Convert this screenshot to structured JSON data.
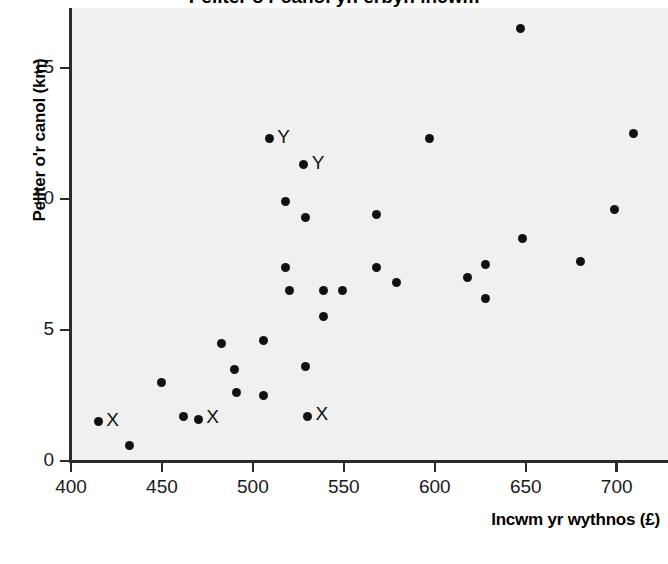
{
  "figure": {
    "background_color": "#ffffff",
    "panel_color": "#f0f0f0",
    "axis_color": "#2b2b2b",
    "marker_color": "#111111",
    "partial_title": "Pellter o'r canol yn erbyn incwm"
  },
  "chart_data": {
    "type": "scatter",
    "title": "",
    "xlabel": "Incwm yr wythnos (£)",
    "ylabel": "Pellter o'r canol (km)",
    "xlim": [
      400,
      720
    ],
    "ylim": [
      0,
      17
    ],
    "xticks": [
      400,
      450,
      500,
      550,
      600,
      650,
      700
    ],
    "xticklabels": [
      "400",
      "450",
      "500",
      "550",
      "600",
      "650",
      "700"
    ],
    "yticks": [
      0,
      5,
      10,
      15
    ],
    "yticklabels": [
      "0",
      "5",
      "10",
      "15"
    ],
    "grid": false,
    "legend": null,
    "marker": "filled-circle",
    "points": [
      {
        "x": 415,
        "y": 1.5,
        "label": "X"
      },
      {
        "x": 432,
        "y": 0.6,
        "label": ""
      },
      {
        "x": 450,
        "y": 3.0,
        "label": ""
      },
      {
        "x": 462,
        "y": 1.7,
        "label": ""
      },
      {
        "x": 470,
        "y": 1.6,
        "label": "X"
      },
      {
        "x": 483,
        "y": 4.5,
        "label": ""
      },
      {
        "x": 490,
        "y": 3.5,
        "label": ""
      },
      {
        "x": 491,
        "y": 2.6,
        "label": ""
      },
      {
        "x": 506,
        "y": 4.6,
        "label": ""
      },
      {
        "x": 506,
        "y": 2.5,
        "label": ""
      },
      {
        "x": 509,
        "y": 12.3,
        "label": "Y"
      },
      {
        "x": 518,
        "y": 9.9,
        "label": ""
      },
      {
        "x": 518,
        "y": 7.4,
        "label": ""
      },
      {
        "x": 520,
        "y": 6.5,
        "label": ""
      },
      {
        "x": 528,
        "y": 11.3,
        "label": "Y"
      },
      {
        "x": 529,
        "y": 9.3,
        "label": ""
      },
      {
        "x": 529,
        "y": 3.6,
        "label": ""
      },
      {
        "x": 530,
        "y": 1.7,
        "label": "X"
      },
      {
        "x": 539,
        "y": 6.5,
        "label": ""
      },
      {
        "x": 539,
        "y": 5.5,
        "label": ""
      },
      {
        "x": 549,
        "y": 6.5,
        "label": ""
      },
      {
        "x": 568,
        "y": 9.4,
        "label": ""
      },
      {
        "x": 568,
        "y": 7.4,
        "label": ""
      },
      {
        "x": 579,
        "y": 6.8,
        "label": ""
      },
      {
        "x": 597,
        "y": 12.3,
        "label": ""
      },
      {
        "x": 618,
        "y": 7.0,
        "label": ""
      },
      {
        "x": 628,
        "y": 7.5,
        "label": ""
      },
      {
        "x": 628,
        "y": 6.2,
        "label": ""
      },
      {
        "x": 647,
        "y": 16.5,
        "label": ""
      },
      {
        "x": 648,
        "y": 8.5,
        "label": ""
      },
      {
        "x": 680,
        "y": 7.6,
        "label": ""
      },
      {
        "x": 699,
        "y": 9.6,
        "label": ""
      },
      {
        "x": 709,
        "y": 12.5,
        "label": ""
      }
    ]
  }
}
